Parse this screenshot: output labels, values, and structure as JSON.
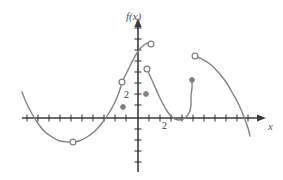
{
  "figure": {
    "kind": "function-graph",
    "background_color": "#ffffff",
    "curve_color": "#808080",
    "axis_color": "#3a3a3a",
    "width": 283,
    "height": 180
  },
  "axes": {
    "y_axis_label": "f(x)",
    "x_axis_label": "x",
    "origin_px": {
      "x": 138,
      "y": 118
    },
    "unit_px": 11,
    "x_tick_label": "2",
    "y_tick_label": "2",
    "x_tick_label_value": 2,
    "y_tick_label_value": 2,
    "x_range_px": {
      "left": 22,
      "right": 266
    },
    "y_range_px": {
      "top": 18,
      "bottom": 172
    },
    "x_ticks_px": [
      27,
      38,
      49,
      60,
      71,
      82,
      93,
      104,
      115,
      126,
      149,
      160,
      171,
      182,
      193,
      204,
      215,
      226,
      237,
      248
    ],
    "y_ticks_px": [
      28,
      39,
      50,
      61,
      72,
      83,
      94,
      105,
      129,
      140,
      151,
      162
    ],
    "grid": false,
    "legend": false
  },
  "chart_data": {
    "type": "line",
    "title": "",
    "subtitle": "",
    "xlabel": "x",
    "ylabel": "f(x)",
    "xlim": [
      -10.5,
      11.5
    ],
    "ylim": [
      -5,
      9
    ],
    "grid": false,
    "legend_position": "none",
    "series": [
      {
        "name": "branch-1-left-parabola",
        "path_px": [
          [
            22,
            92
          ],
          [
            26,
            102
          ],
          [
            31,
            112
          ],
          [
            37,
            122
          ],
          [
            44,
            131
          ],
          [
            52,
            137
          ],
          [
            60,
            141
          ],
          [
            68,
            142
          ],
          [
            73,
            142
          ],
          [
            79,
            141
          ],
          [
            87,
            137
          ],
          [
            95,
            131
          ],
          [
            102,
            123
          ],
          [
            109,
            113
          ],
          [
            114,
            104
          ],
          [
            118,
            95
          ],
          [
            121,
            86
          ],
          [
            122,
            82
          ]
        ],
        "endpoint_open_px": [
          [
            122,
            82
          ],
          [
            73,
            142
          ]
        ]
      },
      {
        "name": "branch-2-rise-to-peak",
        "path_px": [
          [
            122,
            82
          ],
          [
            126,
            74
          ],
          [
            130,
            66
          ],
          [
            134,
            58
          ],
          [
            139,
            50
          ],
          [
            144,
            45
          ],
          [
            148,
            43
          ],
          [
            151,
            44
          ]
        ],
        "endpoint_open_px": [
          [
            151,
            44
          ]
        ]
      },
      {
        "name": "branch-3-descend-to-valley",
        "path_px": [
          [
            147,
            69
          ],
          [
            151,
            78
          ],
          [
            155,
            87
          ],
          [
            159,
            96
          ],
          [
            163,
            104
          ],
          [
            167,
            111
          ],
          [
            171,
            116
          ],
          [
            175,
            119
          ],
          [
            179,
            120
          ],
          [
            183,
            119
          ],
          [
            187,
            116
          ],
          [
            190,
            111
          ]
        ],
        "endpoint_open_px": [
          [
            147,
            69
          ]
        ]
      },
      {
        "name": "branch-4-sharp-rise",
        "path_px": [
          [
            190,
            111
          ],
          [
            191,
            104
          ],
          [
            191,
            96
          ],
          [
            192,
            88
          ],
          [
            192,
            80
          ]
        ],
        "endpoint_filled_px": [
          [
            192,
            80
          ]
        ]
      },
      {
        "name": "branch-5-right-arch",
        "path_px": [
          [
            195,
            56
          ],
          [
            202,
            59
          ],
          [
            210,
            64
          ],
          [
            218,
            72
          ],
          [
            226,
            82
          ],
          [
            233,
            94
          ],
          [
            239,
            105
          ],
          [
            244,
            117
          ],
          [
            248,
            128
          ],
          [
            250,
            136
          ]
        ],
        "endpoint_open_px": [
          [
            195,
            56
          ]
        ]
      }
    ],
    "open_points_px": [
      [
        73,
        142
      ],
      [
        122,
        82
      ],
      [
        151,
        44
      ],
      [
        147,
        69
      ],
      [
        195,
        56
      ]
    ],
    "filled_points_px": [
      [
        123,
        107
      ],
      [
        146,
        94
      ],
      [
        192,
        80
      ]
    ],
    "open_points_count": 5,
    "filled_points_count": 3
  }
}
